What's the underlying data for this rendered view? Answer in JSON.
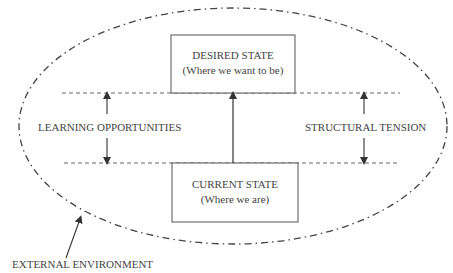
{
  "diagram": {
    "desired_state": {
      "title": "DESIRED STATE",
      "subtitle": "(Where we want to be)"
    },
    "current_state": {
      "title": "CURRENT STATE",
      "subtitle": "(Where we are)"
    },
    "left_label": "LEARNING OPPORTUNITIES",
    "right_label": "STRUCTURAL TENSION",
    "environment_label": "EXTERNAL ENVIRONMENT",
    "colors": {
      "line": "#444444",
      "text": "#444444",
      "background": "#ffffff"
    }
  }
}
